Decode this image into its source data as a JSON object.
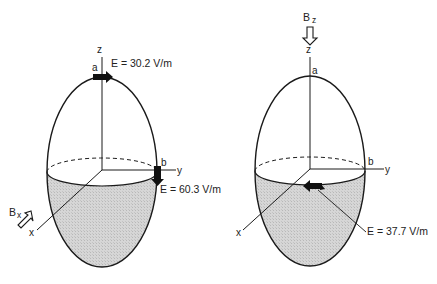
{
  "diagrams": [
    {
      "id": "left",
      "field_label": "B",
      "field_subscript": "x",
      "axes": {
        "z": "z",
        "y": "y",
        "x": "x"
      },
      "points": {
        "a": "a",
        "b": "b"
      },
      "annotations": [
        {
          "point": "a",
          "text": "E = 30.2 V/m"
        },
        {
          "point": "b",
          "text": "E = 60.3 V/m"
        }
      ]
    },
    {
      "id": "right",
      "field_label": "B",
      "field_subscript": "z",
      "axes": {
        "z": "z",
        "y": "y",
        "x": "x"
      },
      "points": {
        "a": "a",
        "b": "b"
      },
      "annotations": [
        {
          "point": "center",
          "text": "E = 37.7 V/m"
        }
      ]
    }
  ],
  "colors": {
    "stroke": "#1a1a1a",
    "fill_shaded": "#cfcfcf",
    "background": "#ffffff"
  }
}
